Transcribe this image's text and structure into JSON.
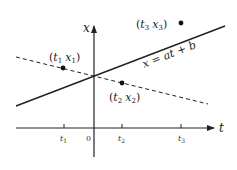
{
  "diagram": {
    "axes": {
      "horizontal_label": "t",
      "vertical_label": "x",
      "origin_label": "0",
      "ticks": [
        "t1",
        "t2",
        "t3"
      ]
    },
    "lines": [
      {
        "name": "fitted-line",
        "style": "solid",
        "equation": "x = at + b"
      },
      {
        "name": "alt-line",
        "style": "dashed"
      }
    ],
    "points": [
      {
        "label_t": "t",
        "sub_t": "1",
        "label_x": "x",
        "sub_x": "1"
      },
      {
        "label_t": "t",
        "sub_t": "2",
        "label_x": "x",
        "sub_x": "2"
      },
      {
        "label_t": "t",
        "sub_t": "3",
        "label_x": "x",
        "sub_x": "3"
      }
    ],
    "colors": {
      "ink": "#222222",
      "background": "#ffffff"
    }
  }
}
